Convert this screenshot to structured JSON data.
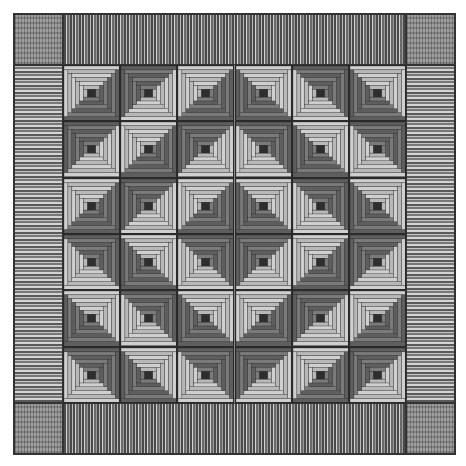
{
  "artwork": {
    "type": "log-cabin quilt",
    "layout": "barn raising",
    "grid": {
      "rows": 6,
      "cols": 6
    },
    "rings_per_block": 6,
    "colors": {
      "light_log": "#cfcfcf",
      "light_log_alt": "#b8b8b8",
      "dark_log": "#5e5e5e",
      "dark_log_alt": "#7a7a7a",
      "center": "#2e2e2e",
      "outline": "#2a2a2a",
      "border_dark": "#4a4a4a",
      "border_light": "#d4d4d4"
    },
    "dark_side_orientation": [
      [
        "BR",
        "TL",
        "BR",
        "BL",
        "TR",
        "BL"
      ],
      [
        "TL",
        "BR",
        "TL",
        "TR",
        "BL",
        "TR"
      ],
      [
        "BR",
        "TL",
        "BR",
        "BL",
        "TR",
        "BL"
      ],
      [
        "TR",
        "BL",
        "TR",
        "TL",
        "BR",
        "TL"
      ],
      [
        "BL",
        "TR",
        "BL",
        "BR",
        "TL",
        "BR"
      ],
      [
        "TR",
        "BL",
        "TR",
        "TL",
        "BR",
        "TL"
      ]
    ]
  }
}
